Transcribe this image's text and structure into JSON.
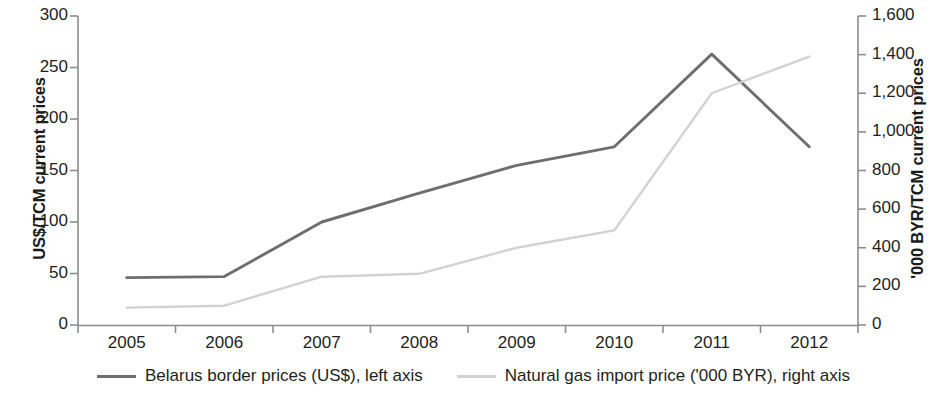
{
  "chart_data": {
    "type": "line",
    "title": "",
    "subtitle": "",
    "xlabel": "",
    "categories": [
      "2005",
      "2006",
      "2007",
      "2008",
      "2009",
      "2010",
      "2011",
      "2012"
    ],
    "grid": false,
    "legend_position": "bottom",
    "axes": {
      "left": {
        "label": "US$/TCM current prices",
        "ticks": [
          "0",
          "50",
          "100",
          "150",
          "200",
          "250",
          "300"
        ],
        "tick_values": [
          0,
          50,
          100,
          150,
          200,
          250,
          300
        ],
        "min": 0,
        "max": 300
      },
      "right": {
        "label": "'000 BYR/TCM current prices",
        "ticks": [
          "0",
          "200",
          "400",
          "600",
          "800",
          "1,000",
          "1,200",
          "1,400",
          "1,600"
        ],
        "tick_values": [
          0,
          200,
          400,
          600,
          800,
          1000,
          1200,
          1400,
          1600
        ],
        "min": 0,
        "max": 1600
      }
    },
    "series": [
      {
        "name": "Belarus border prices (US$), left axis",
        "axis": "left",
        "color": "#6d6e70",
        "values": [
          46,
          47,
          100,
          128,
          155,
          173,
          263,
          173
        ]
      },
      {
        "name": "Natural gas import price ('000 BYR), right axis",
        "axis": "right",
        "color": "#d0d2d3",
        "values": [
          90,
          100,
          250,
          265,
          400,
          490,
          1200,
          1390
        ]
      }
    ]
  },
  "legend": {
    "items": [
      {
        "label": "Belarus border prices (US$), left axis",
        "color": "#6d6e70"
      },
      {
        "label": "Natural gas import price ('000 BYR), right axis",
        "color": "#d0d2d3"
      }
    ]
  }
}
